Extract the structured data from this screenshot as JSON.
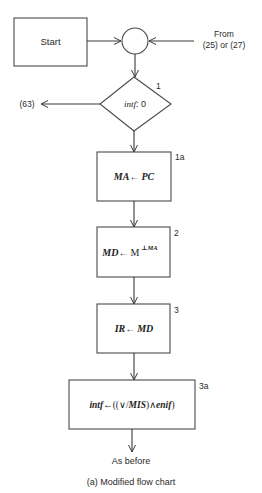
{
  "diagram": {
    "type": "flowchart",
    "caption": "(a) Modified flow chart",
    "colors": {
      "stroke": "#4a4a4a",
      "text": "#2a2a2a",
      "background": "#ffffff"
    },
    "nodes": {
      "start": {
        "label": "Start",
        "shape": "rectangle"
      },
      "junction": {
        "shape": "circle"
      },
      "entry_label": {
        "line1": "From",
        "line2": "(25) or (27)"
      },
      "decision1": {
        "step": "1",
        "var": "intf",
        "rest": ": 0",
        "shape": "diamond"
      },
      "exit_label": "(63)",
      "box1a": {
        "step": "1a",
        "lhs": "MA",
        "arrow": "←",
        "rhs": "PC"
      },
      "box2": {
        "step": "2",
        "lhs": "MD",
        "arrow": "←",
        "rhs": "M",
        "sup": "⊥MA"
      },
      "box3": {
        "step": "3",
        "lhs": "IR",
        "arrow": "←",
        "rhs": "MD"
      },
      "box3a": {
        "step": "3a",
        "lhs": "intf",
        "arrow": "←",
        "expr_open": "((∨/",
        "expr_mis": "MIS",
        "expr_mid": ")∧",
        "expr_enif": "enif",
        "expr_close": ")"
      },
      "end_label": "As before"
    },
    "edges": [
      [
        "start",
        "junction"
      ],
      [
        "entry_label",
        "junction"
      ],
      [
        "junction",
        "decision1"
      ],
      [
        "decision1",
        "exit_label"
      ],
      [
        "decision1",
        "box1a"
      ],
      [
        "box1a",
        "box2"
      ],
      [
        "box2",
        "box3"
      ],
      [
        "box3",
        "box3a"
      ],
      [
        "box3a",
        "end_label"
      ]
    ]
  }
}
